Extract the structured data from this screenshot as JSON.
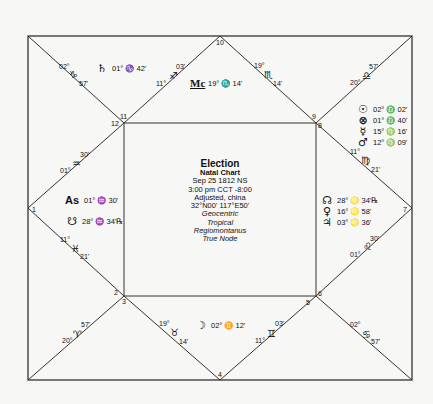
{
  "chart": {
    "title": "Election",
    "subtitle": "Natal Chart",
    "date": "Sep 25 1812 NS",
    "time": "3:00 pm  CCT -8:00",
    "location": "Adjusted, china",
    "coords": "32°N00' 117°E50'",
    "zodiac_frame": "Geocentric",
    "zodiac": "Tropical",
    "house_system": "Regiomontanus",
    "node": "True Node"
  },
  "houses": [
    {
      "num": "1"
    },
    {
      "num": "2"
    },
    {
      "num": "3"
    },
    {
      "num": "4"
    },
    {
      "num": "5"
    },
    {
      "num": "6"
    },
    {
      "num": "7"
    },
    {
      "num": "8"
    },
    {
      "num": "9"
    },
    {
      "num": "10"
    },
    {
      "num": "11"
    },
    {
      "num": "12"
    }
  ],
  "cusps": [
    {
      "name": "cusp-12",
      "deg": "02°",
      "sign": "♑",
      "min": "57'"
    },
    {
      "name": "cusp-11",
      "deg": "11°",
      "sign": "♐",
      "min": "03'"
    },
    {
      "name": "cusp-10-mc",
      "deg": "19°",
      "sign": "♏",
      "min": "14'"
    },
    {
      "name": "cusp-9",
      "deg": "20°",
      "sign": "♎",
      "min": "57'"
    },
    {
      "name": "cusp-8",
      "deg": "11°",
      "sign": "♍",
      "min": "21'"
    },
    {
      "name": "cusp-7",
      "deg": "01°",
      "sign": "♌",
      "min": "30'"
    },
    {
      "name": "cusp-6",
      "deg": "02°",
      "sign": "♋",
      "min": "57'"
    },
    {
      "name": "cusp-5",
      "deg": "11°",
      "sign": "♊",
      "min": "03'"
    },
    {
      "name": "cusp-4",
      "deg": "19°",
      "sign": "♉",
      "min": "14'"
    },
    {
      "name": "cusp-3",
      "deg": "20°",
      "sign": "♈",
      "min": "57'"
    },
    {
      "name": "cusp-2",
      "deg": "11°",
      "sign": "♓",
      "min": "21'"
    },
    {
      "name": "cusp-1",
      "deg": "01°",
      "sign": "♒",
      "min": "30'"
    }
  ],
  "planets": [
    {
      "name": "saturn",
      "glyph": "♄",
      "pos": "01° ♑ 42'"
    },
    {
      "name": "midheaven",
      "glyph": "Mc",
      "pos": "19° ♏ 14'"
    },
    {
      "name": "sun",
      "glyph": "☉",
      "pos": "02° ♎ 02'"
    },
    {
      "name": "part-of-fortune",
      "glyph": "⊗",
      "pos": "01° ♎ 40'"
    },
    {
      "name": "mercury",
      "glyph": "☿",
      "pos": "15° ♍ 16'"
    },
    {
      "name": "mars",
      "glyph": "♂",
      "pos": "12° ♍ 09'"
    },
    {
      "name": "north-node",
      "glyph": "☊",
      "pos": "28° ♌ 34'℞"
    },
    {
      "name": "venus",
      "glyph": "♀",
      "pos": "16° ♌ 58'"
    },
    {
      "name": "jupiter",
      "glyph": "♃",
      "pos": "03° ♌ 36'"
    },
    {
      "name": "moon",
      "glyph": "☽",
      "pos": "02° ♊ 12'"
    },
    {
      "name": "ascendant",
      "glyph": "As",
      "pos": "01° ♒ 30'"
    },
    {
      "name": "south-node",
      "glyph": "☋",
      "pos": "28° ♒ 34'℞"
    }
  ]
}
